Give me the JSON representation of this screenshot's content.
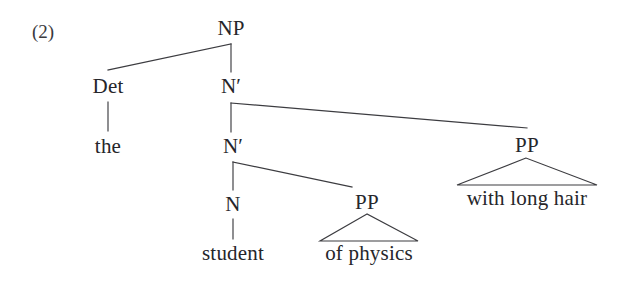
{
  "figure": {
    "example_number": "(2)",
    "ink_color": "#26262a",
    "line_color": "#3c3c40",
    "background_color": "#ffffff"
  },
  "tree": {
    "nodes": [
      {
        "id": "np",
        "label": "NP",
        "x": 231,
        "y": 18
      },
      {
        "id": "det",
        "label": "Det",
        "x": 108,
        "y": 76
      },
      {
        "id": "nbar1",
        "label": "N′",
        "x": 231,
        "y": 76
      },
      {
        "id": "nbar2",
        "label": "N′",
        "x": 233,
        "y": 136
      },
      {
        "id": "pp_hair",
        "label": "PP",
        "x": 527,
        "y": 135
      },
      {
        "id": "n",
        "label": "N",
        "x": 233,
        "y": 194
      },
      {
        "id": "pp_phys",
        "label": "PP",
        "x": 367,
        "y": 192
      }
    ],
    "leaves": [
      {
        "id": "the",
        "label": "the",
        "x": 108,
        "y": 136
      },
      {
        "id": "student",
        "label": "student",
        "x": 233,
        "y": 243
      },
      {
        "id": "physics",
        "label": "of physics",
        "x": 369,
        "y": 243
      },
      {
        "id": "hair",
        "label": "with long hair",
        "x": 527,
        "y": 188
      }
    ],
    "triangles": [
      {
        "id": "triangle-of-physics",
        "apex_x": 367,
        "apex_y": 214,
        "left_x": 320,
        "right_x": 418,
        "base_y": 241
      },
      {
        "id": "triangle-with-long-hair",
        "apex_x": 526,
        "apex_y": 158,
        "left_x": 457,
        "right_x": 597,
        "base_y": 185
      }
    ],
    "edges": [
      {
        "id": "np-to-det",
        "path": "M 231 44 L 108 70"
      },
      {
        "id": "np-to-nbar1",
        "path": "M 231 44 L 231 72"
      },
      {
        "id": "det-to-the",
        "path": "M 108 102 L 108 131"
      },
      {
        "id": "nbar1-to-nbar2",
        "path": "M 231 103 L 231 132"
      },
      {
        "id": "nbar1-to-pp",
        "path": "M 231 103 L 527 128"
      },
      {
        "id": "nbar2-to-n",
        "path": "M 233 162 L 233 190"
      },
      {
        "id": "nbar2-to-pp",
        "path": "M 233 162 L 352 187"
      },
      {
        "id": "n-to-student",
        "path": "M 233 219 L 233 239"
      }
    ]
  }
}
